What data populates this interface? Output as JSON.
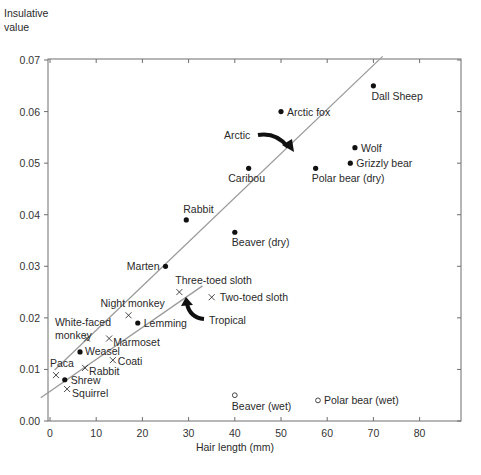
{
  "chart_data": {
    "type": "scatter",
    "title": "",
    "ylabel": "Insulative value",
    "xlabel": "Hair length (mm)",
    "xlim": [
      0,
      89
    ],
    "ylim": [
      0,
      0.07
    ],
    "x_ticks": [
      0,
      10,
      20,
      30,
      40,
      50,
      60,
      70,
      80
    ],
    "y_ticks": [
      "0.00",
      "0.01",
      "0.02",
      "0.03",
      "0.04",
      "0.05",
      "0.06",
      "0.07"
    ],
    "grid": false,
    "legend": "none (markers: filled dot = arctic/temperate, x = tropical, open circle = wet fur)",
    "series": [
      {
        "name": "Arctic / temperate (dry)",
        "marker": "filled-circle",
        "points": [
          {
            "label": "Dall Sheep",
            "x": 70,
            "y": 0.065
          },
          {
            "label": "Arctic fox",
            "x": 50,
            "y": 0.06
          },
          {
            "label": "Wolf",
            "x": 66,
            "y": 0.053
          },
          {
            "label": "Grizzly bear",
            "x": 65,
            "y": 0.05
          },
          {
            "label": "Caribou",
            "x": 43,
            "y": 0.049
          },
          {
            "label": "Polar bear (dry)",
            "x": 57.5,
            "y": 0.049
          },
          {
            "label": "Rabbit",
            "x": 29.5,
            "y": 0.039
          },
          {
            "label": "Beaver (dry)",
            "x": 40,
            "y": 0.0366
          },
          {
            "label": "Marten",
            "x": 25,
            "y": 0.03
          },
          {
            "label": "Lemming",
            "x": 19,
            "y": 0.019
          },
          {
            "label": "Weasel",
            "x": 6.5,
            "y": 0.0134
          },
          {
            "label": "Shrew",
            "x": 3.2,
            "y": 0.008
          }
        ]
      },
      {
        "name": "Tropical",
        "marker": "x",
        "points": [
          {
            "label": "Three-toed sloth",
            "x": 28,
            "y": 0.025
          },
          {
            "label": "Two-toed sloth",
            "x": 35,
            "y": 0.024
          },
          {
            "label": "Night monkey",
            "x": 17,
            "y": 0.0205
          },
          {
            "label": "White-faced monkey",
            "x": 8,
            "y": 0.016
          },
          {
            "label": "Marmoset",
            "x": 12.8,
            "y": 0.016
          },
          {
            "label": "Coati",
            "x": 13.6,
            "y": 0.0118
          },
          {
            "label": "Rabbit",
            "x": 7.6,
            "y": 0.0103
          },
          {
            "label": "Paca",
            "x": 1.3,
            "y": 0.0089
          },
          {
            "label": "Squirrel",
            "x": 3.7,
            "y": 0.0062
          }
        ]
      },
      {
        "name": "Wet fur",
        "marker": "open-circle",
        "points": [
          {
            "label": "Beaver (wet)",
            "x": 40,
            "y": 0.005
          },
          {
            "label": "Polar bear (wet)",
            "x": 58,
            "y": 0.004
          }
        ]
      }
    ],
    "trend_lines": [
      {
        "name": "Arctic",
        "from": {
          "x": 1,
          "y": 0.0099
        },
        "to": {
          "x": 72,
          "y": 0.0707
        }
      },
      {
        "name": "Tropical",
        "from": {
          "x": -2,
          "y": 0.0045
        },
        "to": {
          "x": 33,
          "y": 0.0262
        }
      }
    ],
    "annotations": [
      {
        "text": "Arctic",
        "points_to": "Arctic trend line"
      },
      {
        "text": "Tropical",
        "points_to": "Tropical trend line"
      }
    ]
  },
  "axis": {
    "y_title_line1": "Insulative",
    "y_title_line2": "value",
    "x_title": "Hair length (mm)"
  },
  "annotations": {
    "arctic": "Arctic",
    "tropical": "Tropical"
  },
  "colors": {
    "frame": "#6e6e6e",
    "trend_line": "#9a9a9a",
    "marker": "#111111",
    "text": "#2a2a2a",
    "arrow": "#111111"
  }
}
